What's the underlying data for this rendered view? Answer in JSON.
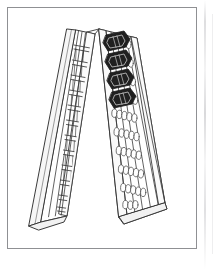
{
  "figure": {
    "style": "patent line drawing",
    "line_color": "#3a3a3a",
    "fill_color": "#ffffff",
    "shade_color": "#e8e8e8",
    "dark_object_color": "#202020",
    "frame_color": "#8f9093",
    "background_color": "#ffffff"
  },
  "panels": [
    {
      "id": "left-panel",
      "name": "ladder-grid-panel",
      "lean": "leans right toward apex",
      "pattern": "ladder-brick-grid",
      "rung_count": 13,
      "column_count": 4,
      "side_rail": "visible left edge thickness",
      "occupied_cells": 0
    },
    {
      "id": "right-panel",
      "name": "oval-hole-panel",
      "lean": "leans left toward apex",
      "pattern": "oval-hole-grid",
      "hole_rows": 10,
      "hole_columns": 5,
      "hole_shape": "vertical oval",
      "occupied_holes": 4
    }
  ],
  "dark_objects": {
    "name": "cylindrical-inserts",
    "count": 4,
    "shape": "capped cylinder",
    "color": "#202020",
    "placement": "upper portion of the oval-hole panel, arranged in a descending diagonal",
    "items": [
      {
        "index": 1,
        "position": "row 1"
      },
      {
        "index": 2,
        "position": "row 2"
      },
      {
        "index": 3,
        "position": "row 3"
      },
      {
        "index": 4,
        "position": "row 4"
      }
    ]
  },
  "apex": {
    "name": "hinge-apex",
    "description": "the two panels meet at the top forming an inverted V"
  },
  "page": {
    "border": "thin gray rectangular frame",
    "scan_artifact": "faint vertical marks along the right margin"
  }
}
